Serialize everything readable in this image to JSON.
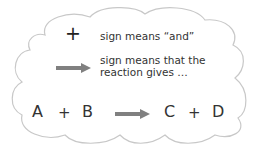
{
  "legend": {
    "plus_symbol": "+",
    "plus_meaning": "sign means “and”",
    "arrow_meaning_line1": "sign means that the",
    "arrow_meaning_line2": "reaction gives …"
  },
  "equation": {
    "reactant_1": "A",
    "plus_1": "+",
    "reactant_2": "B",
    "product_1": "C",
    "plus_2": "+",
    "product_2": "D"
  },
  "colors": {
    "cloud_outline": "#c8c8c8",
    "arrow": "#808080",
    "text": "#333333"
  }
}
